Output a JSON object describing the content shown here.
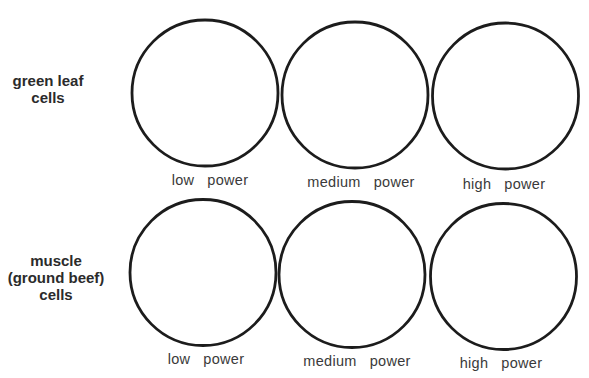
{
  "rows": [
    {
      "id": "green-leaf",
      "label_lines": [
        "green leaf",
        "cells"
      ],
      "panels": [
        {
          "magnification": "low",
          "label": "low   power"
        },
        {
          "magnification": "medium",
          "label": "medium   power"
        },
        {
          "magnification": "high",
          "label": "high   power"
        }
      ]
    },
    {
      "id": "muscle",
      "label_lines": [
        "muscle",
        "(ground beef)",
        "cells"
      ],
      "panels": [
        {
          "magnification": "low",
          "label": "low   power"
        },
        {
          "magnification": "medium",
          "label": "medium   power"
        },
        {
          "magnification": "high",
          "label": "high   power"
        }
      ]
    }
  ],
  "colors": {
    "circle_stroke": "#1c1c1c",
    "text": "#2b2b2b",
    "background": "#ffffff"
  }
}
